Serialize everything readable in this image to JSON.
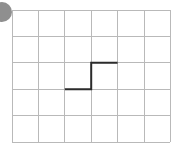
{
  "figure": {
    "title": "",
    "width": 182,
    "height": 155,
    "background_color": "#ffffff"
  },
  "grid": {
    "columns": 6,
    "rows": 5,
    "cell_width": 26.4,
    "cell_height": 26.4,
    "origin_x": 12,
    "origin_y": 10,
    "line_color": "#b9b9b9",
    "line_width": 1,
    "x_lines": [
      12,
      38.4,
      64.8,
      91.2,
      117.6,
      144,
      170
    ],
    "y_lines": [
      10,
      36.4,
      62.8,
      89.2,
      115.6,
      142
    ]
  },
  "marker": {
    "name": "corner-dot",
    "shape": "circle",
    "center_x": 2,
    "center_y": 12,
    "radius": 10,
    "color": "#8f8f8f",
    "clipped": "left-edge"
  },
  "chart_data": {
    "type": "line",
    "title": "",
    "subtitle": "",
    "xlabel": "",
    "ylabel": "",
    "grid": true,
    "legend": null,
    "legend_position": "none",
    "xlim": [
      0,
      6
    ],
    "ylim": [
      0,
      5
    ],
    "x_ticks": [
      0,
      1,
      2,
      3,
      4,
      5,
      6
    ],
    "y_ticks": [
      0,
      1,
      2,
      3,
      4,
      5
    ],
    "x_tick_labels": [
      "",
      "",
      "",
      "",
      "",
      "",
      ""
    ],
    "y_tick_labels": [
      "",
      "",
      "",
      "",
      "",
      ""
    ],
    "series": [
      {
        "name": "step",
        "style": "step-post",
        "color": "#2b2b2b",
        "line_width": 2,
        "x": [
          2,
          3,
          3,
          4
        ],
        "y": [
          2,
          2,
          3,
          3
        ],
        "pixel_points": [
          [
            64.8,
            89.2
          ],
          [
            91.2,
            89.2
          ],
          [
            91.2,
            62.8
          ],
          [
            117.6,
            62.8
          ]
        ]
      }
    ],
    "annotations": []
  }
}
